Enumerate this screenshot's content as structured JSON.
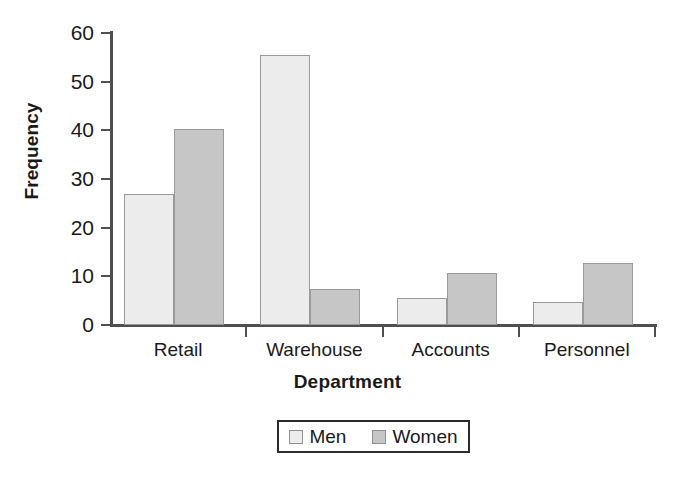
{
  "chart_data": {
    "type": "bar",
    "title": "",
    "subtitle": "",
    "xlabel": "Department",
    "ylabel": "Frequency",
    "categories": [
      "Retail",
      "Warehouse",
      "Accounts",
      "Personnel"
    ],
    "series": [
      {
        "name": "Men",
        "color": "#ececec",
        "values": [
          27.0,
          55.5,
          5.6,
          4.8
        ]
      },
      {
        "name": "Women",
        "color": "#c6c6c6",
        "values": [
          40.3,
          7.5,
          10.7,
          12.7
        ]
      }
    ],
    "ylim": [
      0,
      60
    ],
    "yticks": [
      0,
      10,
      20,
      30,
      40,
      50,
      60
    ],
    "ytick_labels": [
      "0",
      "10",
      "20",
      "30",
      "40",
      "50",
      "60"
    ],
    "grid": false,
    "legend_position": "bottom-center",
    "legend_entries": [
      "Men",
      "Women"
    ],
    "axis_color": "#4f4f4f",
    "bar_border_color": "#9a9a9a",
    "background": "#ffffff"
  },
  "axes": {
    "y_title": "Frequency",
    "x_title": "Department"
  },
  "legend": {
    "items": [
      {
        "label": "Men"
      },
      {
        "label": "Women"
      }
    ]
  }
}
